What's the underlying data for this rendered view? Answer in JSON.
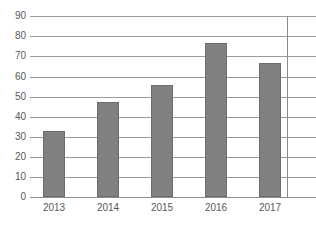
{
  "chart_data": {
    "type": "bar",
    "title": "",
    "subtitle": "",
    "xlabel": "",
    "ylabel": "",
    "categories": [
      "2013",
      "2014",
      "2015",
      "2016",
      "2017"
    ],
    "values": [
      32.8,
      47.3,
      55.7,
      76.6,
      66.7
    ],
    "series": [
      {
        "name": "",
        "values": [
          32.8,
          47.3,
          55.7,
          76.6,
          66.7
        ]
      }
    ],
    "ylim": [
      0,
      90
    ],
    "ytick_step": 10,
    "yticks": [
      "0",
      "10",
      "20",
      "30",
      "40",
      "50",
      "60",
      "70",
      "80",
      "90"
    ],
    "xlim_categories": 5,
    "grid": true,
    "grid_axis": "y",
    "legend": false,
    "legend_position": "none",
    "annotations": [],
    "colors": {
      "bar_fill": "#808080",
      "bar_stroke": "#6e6e6e",
      "gridline": "#9a9a9a",
      "baseline": "#8c8c8c",
      "axis_border": "#8a8a8a",
      "tick_label": "#58595b",
      "background": "#ffffff"
    }
  }
}
